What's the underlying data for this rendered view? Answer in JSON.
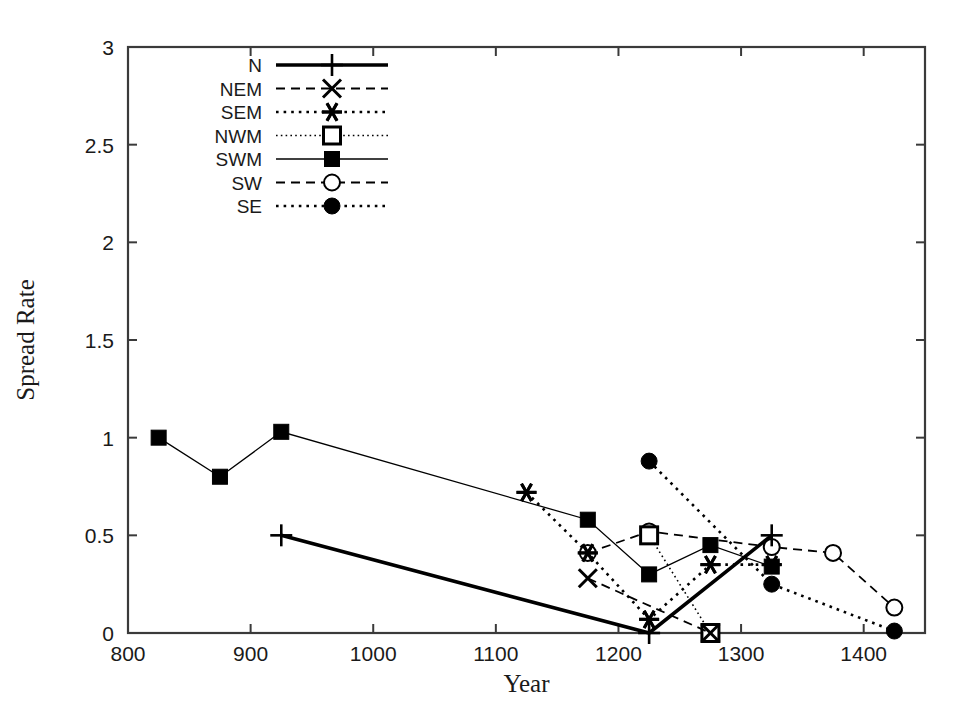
{
  "chart_data": {
    "type": "line",
    "title": "",
    "xlabel": "Year",
    "ylabel": "Spread Rate",
    "xlim": [
      800,
      1450
    ],
    "ylim": [
      0,
      3
    ],
    "xticks": [
      800,
      900,
      1000,
      1100,
      1200,
      1300,
      1400
    ],
    "yticks": [
      0,
      0.5,
      1,
      1.5,
      2,
      2.5,
      3
    ],
    "xtick_labels": [
      "800",
      "900",
      "1000",
      "1100",
      "1200",
      "1300",
      "1400"
    ],
    "ytick_labels": [
      "0",
      "0.5",
      "1",
      "1.5",
      "2",
      "2.5",
      "3"
    ],
    "grid": false,
    "legend_position": "top-left-inside",
    "series": [
      {
        "name": "N",
        "marker": "plus",
        "line": "solid-thick",
        "color": "#000000",
        "x": [
          925,
          1225,
          1325
        ],
        "y": [
          0.5,
          0.0,
          0.5
        ]
      },
      {
        "name": "NEM",
        "marker": "cross",
        "line": "dashed",
        "color": "#000000",
        "x": [
          1175,
          1275
        ],
        "y": [
          0.28,
          0.0
        ]
      },
      {
        "name": "SEM",
        "marker": "star",
        "line": "dotted",
        "color": "#000000",
        "x": [
          1125,
          1175,
          1225,
          1275,
          1325
        ],
        "y": [
          0.72,
          0.41,
          0.07,
          0.35,
          0.35
        ]
      },
      {
        "name": "NWM",
        "marker": "open-square",
        "line": "fine-dotted",
        "color": "#000000",
        "x": [
          1225,
          1275
        ],
        "y": [
          0.5,
          0.0
        ]
      },
      {
        "name": "SWM",
        "marker": "filled-square",
        "line": "solid-thin",
        "color": "#000000",
        "x": [
          825,
          875,
          925,
          1175,
          1225,
          1275,
          1325
        ],
        "y": [
          1.0,
          0.8,
          1.03,
          0.58,
          0.3,
          0.45,
          0.34
        ]
      },
      {
        "name": "SW",
        "marker": "open-circle",
        "line": "dashed",
        "color": "#000000",
        "x": [
          1175,
          1225,
          1325,
          1375,
          1425
        ],
        "y": [
          0.41,
          0.52,
          0.44,
          0.41,
          0.13
        ]
      },
      {
        "name": "SE",
        "marker": "filled-circle",
        "line": "dotted",
        "color": "#000000",
        "x": [
          1225,
          1325,
          1425
        ],
        "y": [
          0.88,
          0.25,
          0.01
        ]
      }
    ]
  },
  "legend": {
    "entries": [
      {
        "label": "N"
      },
      {
        "label": "NEM"
      },
      {
        "label": "SEM"
      },
      {
        "label": "NWM"
      },
      {
        "label": "SWM"
      },
      {
        "label": "SW"
      },
      {
        "label": "SE"
      }
    ]
  }
}
